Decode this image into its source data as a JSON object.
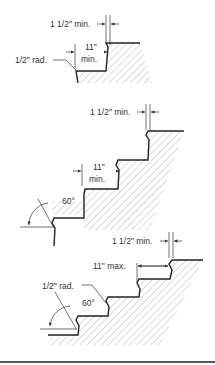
{
  "diagram": {
    "figures": [
      {
        "id": "top",
        "labels": {
          "nosing_projection": "1 1/2\" min.",
          "tread_depth_line1": "11\"",
          "tread_depth_line2": "min.",
          "radius": "1/2\" rad."
        }
      },
      {
        "id": "middle",
        "labels": {
          "nosing_projection": "1 1/2\" min.",
          "tread_depth_line1": "11\"",
          "tread_depth_line2": "min.",
          "angle": "60°"
        }
      },
      {
        "id": "bottom",
        "labels": {
          "nosing_projection": "1 1/2\" min.",
          "tread_depth": "11\" max.",
          "radius": "1/2\" rad.",
          "angle": "60°"
        }
      }
    ],
    "colors": {
      "line": "#222222",
      "hatch": "#666666",
      "background": "#ffffff"
    }
  }
}
